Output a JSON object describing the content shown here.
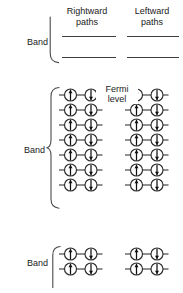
{
  "figure": {
    "title_columns": {
      "rightward": "Rightward\npaths",
      "rightward_line1": "Rightward",
      "rightward_line2": "paths",
      "leftward_line1": "Leftward",
      "leftward_line2": "paths"
    },
    "annotations": {
      "fermi_line1": "Fermi",
      "fermi_line2": "level"
    },
    "colors": {
      "ink": "#1a1a1a",
      "stroke": "#3d3d3d",
      "orbital_fill": "#ffffff",
      "spin_arrow": "#101010",
      "background": "#ffffff"
    },
    "bands": [
      {
        "label": "Band",
        "kind": "empty-levels",
        "level_count_per_column": 2,
        "columns": [
          "rightward",
          "leftward"
        ]
      },
      {
        "label": "Band",
        "kind": "filled-states",
        "row_count": 7,
        "columns": [
          "rightward",
          "leftward"
        ],
        "spins_per_row": [
          "up",
          "down"
        ],
        "fermi_level_marked": true
      },
      {
        "label": "Band",
        "kind": "filled-states",
        "row_count": 2,
        "columns": [
          "rightward",
          "leftward"
        ],
        "spins_per_row": [
          "up",
          "down"
        ],
        "fermi_level_marked": false
      }
    ],
    "glyphs": {
      "spin_up": "spin-up-arrow",
      "spin_down": "spin-down-arrow",
      "orbital": "orbital-circle"
    }
  }
}
